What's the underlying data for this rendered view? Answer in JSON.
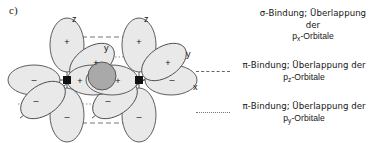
{
  "figure": {
    "panel_label": "c)",
    "background": "#ffffff",
    "line_color": "#4d4d4d",
    "lobe_fill": "#e8e8e8",
    "overlap_fill": "#a8a8a8",
    "nucleus_color": "#111111"
  },
  "diagram": {
    "atoms": [
      {
        "id": "left-atom",
        "cx": 67,
        "cy": 80
      },
      {
        "id": "right-atom",
        "cx": 139,
        "cy": 80
      }
    ],
    "axes": [
      {
        "name": "z",
        "label": "z",
        "atom": "left-atom",
        "direction": "up"
      },
      {
        "name": "z",
        "label": "z",
        "atom": "right-atom",
        "direction": "up"
      },
      {
        "name": "x",
        "label": "x",
        "atom": "shared",
        "direction": "right"
      },
      {
        "name": "y",
        "label": "y",
        "atom": "left-atom",
        "direction": "down-left"
      },
      {
        "name": "y",
        "label": "y",
        "atom": "right-atom",
        "direction": "up-right"
      }
    ],
    "axis_labels": {
      "z_left": "z",
      "z_right": "z",
      "x": "x",
      "y_left": "y",
      "y_right": "y"
    },
    "phase_signs": {
      "plus": "+",
      "minus": "–"
    },
    "lobe_signs": [
      {
        "id": "left-pz-up",
        "sign": "+"
      },
      {
        "id": "left-pz-down",
        "sign": "–"
      },
      {
        "id": "left-px-left",
        "sign": "–"
      },
      {
        "id": "left-px-right",
        "sign": "+"
      },
      {
        "id": "left-py-up",
        "sign": "+"
      },
      {
        "id": "left-py-down",
        "sign": "–"
      },
      {
        "id": "right-pz-up",
        "sign": "+"
      },
      {
        "id": "right-pz-down",
        "sign": "–"
      },
      {
        "id": "right-px-left",
        "sign": "+"
      },
      {
        "id": "right-px-right",
        "sign": "–"
      },
      {
        "id": "right-py-up",
        "sign": "+"
      },
      {
        "id": "right-py-down",
        "sign": "–"
      }
    ]
  },
  "legend": {
    "entries": [
      {
        "id": "sigma-px",
        "marker": "none",
        "line1": "σ-Bindung; Überlappung der",
        "line2_prefix": "p",
        "line2_sub": "x",
        "line2_suffix": "-Orbitale"
      },
      {
        "id": "pi-pz",
        "marker": "dashdot",
        "line1": "π-Bindung; Überlappung der",
        "line2_prefix": "p",
        "line2_sub": "z",
        "line2_suffix": "-Orbitale"
      },
      {
        "id": "pi-py",
        "marker": "dotted",
        "line1": "π-Bindung; Überlappung der",
        "line2_prefix": "p",
        "line2_sub": "y",
        "line2_suffix": "-Orbitale"
      }
    ]
  }
}
